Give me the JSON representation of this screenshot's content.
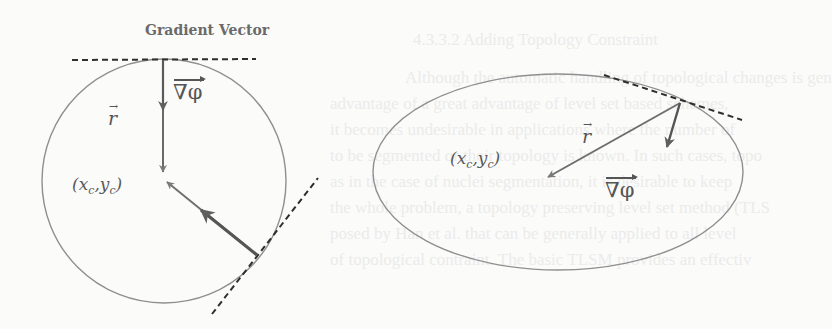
{
  "figure": {
    "title": "Gradient Vector",
    "left_shape": {
      "type": "circle",
      "center_label": "(x_c, y_c)",
      "center_label_display": "(x",
      "radius_label": "r",
      "gradient_label": "∇φ"
    },
    "right_shape": {
      "type": "ellipse",
      "center_label": "(x_c, y_c)",
      "radius_label": "r",
      "gradient_label": "∇φ"
    },
    "labels": {
      "xc_base": "x",
      "yc_base": "y",
      "sub_c": "c",
      "open_paren": "(",
      "comma": ",",
      "close_paren": ")",
      "r": "r",
      "r_arrow": "→",
      "nabla_phi": "∇φ"
    },
    "colors": {
      "background": "#fbfbfa",
      "outline": "#8a8a8a",
      "arrow": "#5f5f5f",
      "tangent_dash": "#2e2e2e",
      "bleed_text": "#ebebea"
    }
  },
  "bleed_through_text": {
    "heading": "4.3.3.2 Adding Topology Constraint",
    "lines": [
      "Although the automatic handling of topological changes is gen",
      "advantage of a great advantage of level set based schemes,",
      "it becomes undesirable in applications where the number of",
      "to be segmented or their topology is known. In such cases, topo",
      "as in the case of nuclei segmentation, it is desirable to keep",
      "the whole problem, a topology preserving level set method (TLS",
      "posed by Han et al. that can be generally applied to all level",
      "of topological contraint. The basic TLSM provides an effectiv"
    ]
  }
}
